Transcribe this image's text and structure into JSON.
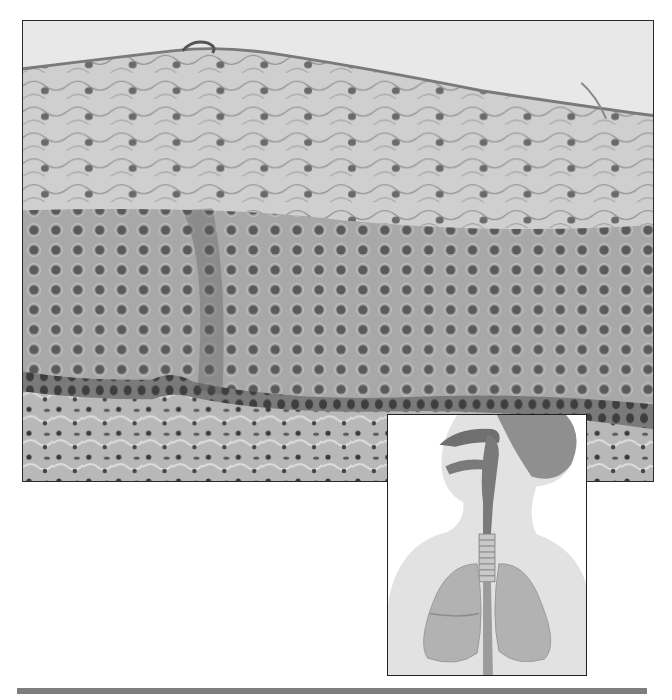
{
  "figure": {
    "tone": "grayscale",
    "colors": {
      "background": "#ffffff",
      "lumen": "#e8e8e8",
      "superficial_layer": "#c9c9c9",
      "intermediate_layer": "#a9a9a9",
      "basal_layer": "#6e6e6e",
      "connective_tissue": "#b5b5b5",
      "nucleus": "#4a4a4a",
      "frame": "#2a2a2a",
      "rule": "#7d7d7d"
    }
  },
  "inset": {
    "subject": "Respiratory tract locator illustration",
    "parts": [
      "head",
      "nasal-cavity",
      "pharynx",
      "trachea",
      "left-lung",
      "right-lung",
      "esophagus"
    ]
  }
}
